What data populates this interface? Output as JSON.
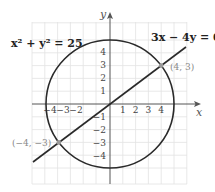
{
  "diagram": {
    "axes": {
      "x_label": "x",
      "y_label": "y",
      "x_ticks": [
        "−4",
        "−3",
        "−2",
        "1",
        "2",
        "3",
        "4"
      ],
      "y_ticks": [
        "4",
        "3",
        "2",
        "1",
        "−1",
        "−2",
        "−3",
        "−4"
      ]
    },
    "equations": {
      "circle": "x² + y² = 25",
      "line": "3x − 4y = 0"
    },
    "points": [
      {
        "label": "(4, 3)",
        "x": 4,
        "y": 3
      },
      {
        "label": "(−4, −3)",
        "x": -4,
        "y": -3
      }
    ],
    "colors": {
      "curve": "#2a2a2a",
      "grid": "#e2e2e2",
      "point_label": "#888888",
      "point_marker": "#999999"
    }
  }
}
